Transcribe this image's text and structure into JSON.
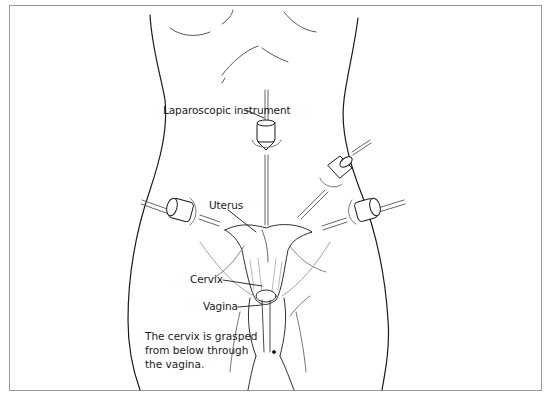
{
  "figure": {
    "labels": {
      "instrument": "Laparoscopic instrument",
      "uterus": "Uterus",
      "cervix": "Cervix",
      "vagina": "Vagina"
    },
    "caption_lines": [
      "The cervix is grasped",
      "from below through",
      "the vagina."
    ],
    "colors": {
      "line": "#1a1a1a",
      "frame": "#9a9a9a",
      "background": "#ffffff"
    },
    "instruments": [
      {
        "name": "top-center-port"
      },
      {
        "name": "upper-right-port"
      },
      {
        "name": "left-port"
      },
      {
        "name": "right-port"
      }
    ]
  }
}
